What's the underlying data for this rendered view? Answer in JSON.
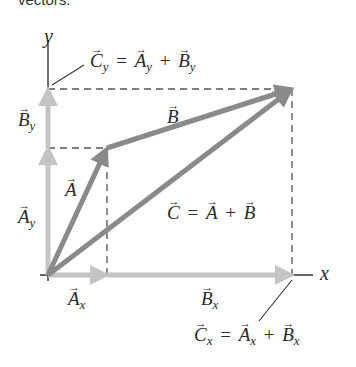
{
  "header": {
    "text": "vectors."
  },
  "axes": {
    "x_label": "x",
    "y_label": "y"
  },
  "colors": {
    "background": "#ffffff",
    "resultant_vectors": "#8a8a8a",
    "component_vectors": "#c4c4c4",
    "axis": "#333333",
    "dashed": "#555555",
    "text": "#2a2a2a"
  },
  "vectors": {
    "A": {
      "symbol": "A",
      "tail": [
        48,
        275
      ],
      "head": [
        107,
        148
      ]
    },
    "B": {
      "symbol": "B",
      "tail": [
        107,
        148
      ],
      "head": [
        292,
        89
      ]
    },
    "C": {
      "symbol": "C",
      "tail": [
        48,
        275
      ],
      "head": [
        292,
        89
      ]
    },
    "Ax": {
      "symbol": "A",
      "sub": "x",
      "tail": [
        48,
        275
      ],
      "head": [
        107,
        275
      ]
    },
    "Bx": {
      "symbol": "B",
      "sub": "x",
      "tail": [
        107,
        275
      ],
      "head": [
        292,
        275
      ]
    },
    "Ay": {
      "symbol": "A",
      "sub": "y",
      "tail": [
        48,
        275
      ],
      "head": [
        48,
        148
      ]
    },
    "By": {
      "symbol": "B",
      "sub": "y",
      "tail": [
        48,
        148
      ],
      "head": [
        48,
        89
      ]
    }
  },
  "labels": {
    "A": {
      "vec": "A"
    },
    "B": {
      "vec": "B"
    },
    "C_eq": {
      "lhs": "C",
      "eq": "=",
      "a": "A",
      "plus": "+",
      "b": "B"
    },
    "Ax": {
      "vec": "A",
      "sub": "x"
    },
    "Bx": {
      "vec": "B",
      "sub": "x"
    },
    "Ay": {
      "vec": "A",
      "sub": "y"
    },
    "By": {
      "vec": "B",
      "sub": "y"
    },
    "Cy_eq": {
      "lhs": "C",
      "lhs_sub": "y",
      "eq": "=",
      "a": "A",
      "a_sub": "y",
      "plus": "+",
      "b": "B",
      "b_sub": "y"
    },
    "Cx_eq": {
      "lhs": "C",
      "lhs_sub": "x",
      "eq": "=",
      "a": "A",
      "a_sub": "x",
      "plus": "+",
      "b": "B",
      "b_sub": "x"
    }
  }
}
